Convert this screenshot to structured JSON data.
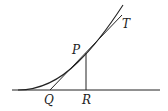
{
  "diagram": {
    "type": "tangent-subtangent",
    "labels": {
      "P": "P",
      "T": "T",
      "Q": "Q",
      "R": "R"
    },
    "colors": {
      "stroke": "#222222",
      "background": "#ffffff"
    }
  }
}
